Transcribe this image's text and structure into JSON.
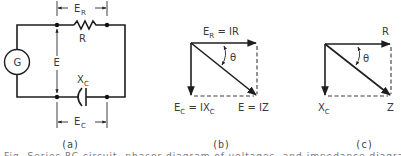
{
  "figure": {
    "panel_a": {
      "caption": "(a)",
      "generator_label": "G",
      "voltage_label": "E",
      "resistor_label": "R",
      "capacitor_label_main": "X",
      "capacitor_label_sub": "C",
      "er_label_main": "E",
      "er_label_sub": "R",
      "ec_label_main": "E",
      "ec_label_sub": "C"
    },
    "panel_b": {
      "caption": "(b)",
      "top_label_main": "E",
      "top_label_sub": "R",
      "top_label_rest": " = IR",
      "angle_label": "θ",
      "left_label_main": "E",
      "left_label_sub": "C",
      "left_label_mid": " = IX",
      "left_label_sub2": "C",
      "diag_label": "E = IZ"
    },
    "panel_c": {
      "caption": "(c)",
      "top_label": "R",
      "angle_label": "θ",
      "left_label_main": "X",
      "left_label_sub": "C",
      "diag_label": "Z"
    },
    "clipped_caption_line": "Fig. Series RC circuit, phasor diagram of voltages, and impedance diagram"
  }
}
